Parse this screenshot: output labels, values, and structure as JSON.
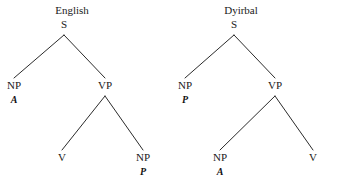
{
  "figure": {
    "background_color": "#ffffff",
    "line_color": "#2b2b2b",
    "text_color": "#1a1a1a"
  },
  "trees": [
    {
      "id": "english",
      "title": "English",
      "title_x": 72,
      "title_y": 5,
      "nodes": [
        {
          "name": "s",
          "label": "S",
          "role": "",
          "x": 64,
          "y": 19
        },
        {
          "name": "np-subject",
          "label": "NP",
          "role": "A",
          "x": 14,
          "y": 80
        },
        {
          "name": "vp",
          "label": "VP",
          "role": "",
          "x": 105,
          "y": 80
        },
        {
          "name": "v",
          "label": "V",
          "role": "",
          "x": 62,
          "y": 152
        },
        {
          "name": "np-object",
          "label": "NP",
          "role": "P",
          "x": 143,
          "y": 152
        }
      ],
      "edges": [
        {
          "name": "s-to-np",
          "x1": 64,
          "y1": 35,
          "x2": 14,
          "y2": 78
        },
        {
          "name": "s-to-vp",
          "x1": 64,
          "y1": 35,
          "x2": 105,
          "y2": 78
        },
        {
          "name": "vp-to-v",
          "x1": 105,
          "y1": 96,
          "x2": 62,
          "y2": 150
        },
        {
          "name": "vp-to-np",
          "x1": 105,
          "y1": 96,
          "x2": 143,
          "y2": 150
        }
      ]
    },
    {
      "id": "dyirbal",
      "title": "Dyirbal",
      "title_x": 241,
      "title_y": 5,
      "nodes": [
        {
          "name": "s",
          "label": "S",
          "role": "",
          "x": 234,
          "y": 19
        },
        {
          "name": "np-subject",
          "label": "NP",
          "role": "P",
          "x": 185,
          "y": 80
        },
        {
          "name": "vp",
          "label": "VP",
          "role": "",
          "x": 275,
          "y": 80
        },
        {
          "name": "np-object",
          "label": "NP",
          "role": "A",
          "x": 220,
          "y": 152
        },
        {
          "name": "v",
          "label": "V",
          "role": "",
          "x": 313,
          "y": 152
        }
      ],
      "edges": [
        {
          "name": "s-to-np",
          "x1": 234,
          "y1": 35,
          "x2": 185,
          "y2": 78
        },
        {
          "name": "s-to-vp",
          "x1": 234,
          "y1": 35,
          "x2": 275,
          "y2": 78
        },
        {
          "name": "vp-to-np",
          "x1": 275,
          "y1": 96,
          "x2": 220,
          "y2": 150
        },
        {
          "name": "vp-to-v",
          "x1": 275,
          "y1": 96,
          "x2": 313,
          "y2": 150
        }
      ]
    }
  ]
}
